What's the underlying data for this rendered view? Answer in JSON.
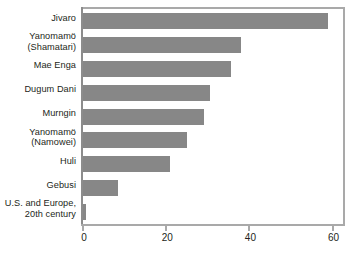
{
  "chart_data": {
    "type": "bar",
    "orientation": "horizontal",
    "title": "",
    "subtitle": "",
    "xlabel": "",
    "ylabel": "",
    "xlim": [
      0,
      62.5
    ],
    "xticks": [
      0,
      20,
      40,
      60
    ],
    "xtick_labels": [
      "0",
      "20",
      "40",
      "60"
    ],
    "grid": false,
    "legend": false,
    "bar_color": "#878787",
    "frame_color": "#a9a9a9",
    "text_color": "#231f20",
    "categories": [
      "Jivaro",
      "Yanomamö\n(Shamatari)",
      "Mae Enga",
      "Dugum Dani",
      "Murngin",
      "Yanomamö\n(Namowei)",
      "Huli",
      "Gebusi",
      "U.S. and Europe,\n20th century"
    ],
    "values": [
      59,
      38,
      35.5,
      30.5,
      29,
      25,
      21,
      8.3,
      0.7
    ]
  }
}
